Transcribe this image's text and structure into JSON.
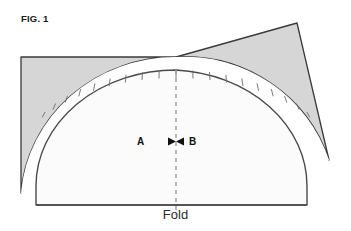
{
  "figure": {
    "title": "FIG. 1",
    "fold_label": "Fold",
    "label_a": "A",
    "label_b": "B",
    "colors": {
      "shaded_fill": "#d6d6d6",
      "inner_fill": "#fbfbfb",
      "outline": "#3a3a3a",
      "dashed_line": "#9a9a9a",
      "background": "#ffffff",
      "text": "#1a1a1a"
    },
    "geometry": {
      "fold_line_y": 205,
      "fold_line_x_start": 36,
      "fold_line_x_end": 307,
      "center_x": 176,
      "inner_arc_top_y": 70,
      "outer_arc_top_y": 57,
      "left_panel_x": 21,
      "left_panel_top_y": 57,
      "left_tip_y": 193,
      "right_wedge_apex_x": 297,
      "right_wedge_apex_y": 23,
      "right_tip_x": 329,
      "right_tip_y": 160,
      "tick_count": 17
    }
  }
}
